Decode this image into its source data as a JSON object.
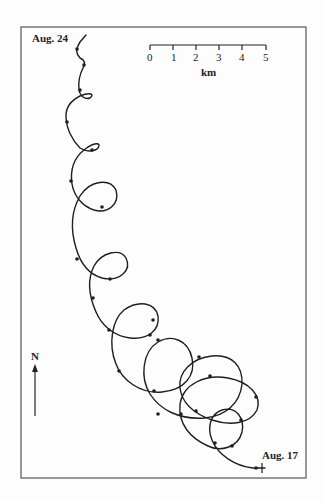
{
  "figure": {
    "start_label": "Aug. 17",
    "end_label": "Aug. 24",
    "north_label": "N",
    "scale_bar": {
      "unit": "km",
      "ticks": [
        "0",
        "1",
        "2",
        "3",
        "4",
        "5"
      ]
    },
    "colors": {
      "ink": "#1e1e1e",
      "frame": "#555555",
      "background": "#fdfdfd"
    }
  }
}
